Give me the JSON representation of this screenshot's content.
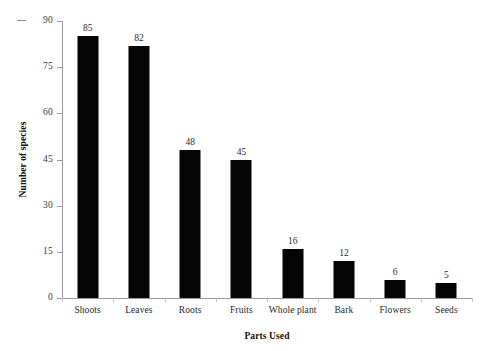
{
  "chart_data": {
    "type": "bar",
    "title": "",
    "xlabel": "Parts Used",
    "ylabel": "Number of species",
    "categories": [
      "Shoots",
      "Leaves",
      "Roots",
      "Fruits",
      "Whole plant",
      "Bark",
      "Flowers",
      "Seeds"
    ],
    "values": [
      85,
      82,
      48,
      45,
      16,
      12,
      6,
      5
    ],
    "value_labels": [
      "85",
      "82",
      "48",
      "45",
      "16",
      "12",
      "6",
      "5"
    ],
    "ylim": [
      0,
      90
    ],
    "yticks": [
      0,
      15,
      30,
      45,
      60,
      75,
      90
    ],
    "ytick_labels": [
      "0",
      "15",
      "30",
      "45",
      "60",
      "75",
      "90"
    ],
    "grid": false,
    "legend": false,
    "legend_position": "none",
    "bar_color": "#050505",
    "axis_color": "#9a9a9a",
    "background_color": "#ffffff"
  }
}
